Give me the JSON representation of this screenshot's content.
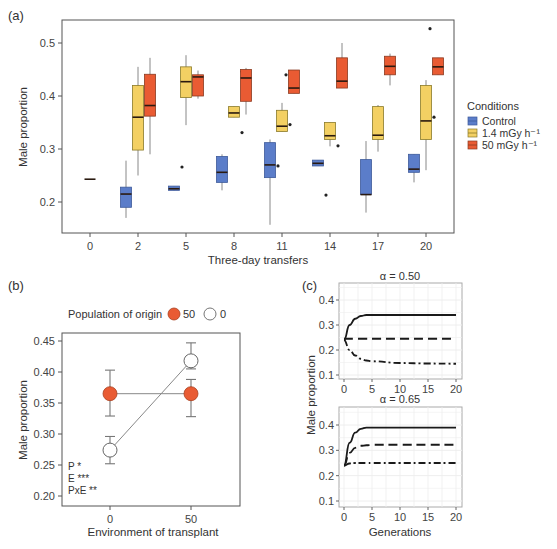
{
  "panels": {
    "a": {
      "label": "(a)"
    },
    "b": {
      "label": "(b)"
    },
    "c": {
      "label": "(c)"
    }
  },
  "colors": {
    "control": "#5b7dc9",
    "low": "#f3d063",
    "high": "#e95b33",
    "axis": "#555555",
    "outline_control": "#3d5a9a",
    "outline_low": "#8a7a2a",
    "outline_high": "#8a3a20"
  },
  "chart_data": [
    {
      "panel": "a",
      "type": "box",
      "title": "",
      "xlabel": "Three-day transfers",
      "ylabel": "Male proportion",
      "ylim": [
        0.14,
        0.55
      ],
      "yticks": [
        0.2,
        0.3,
        0.4,
        0.5
      ],
      "categories": [
        "0",
        "2",
        "5",
        "8",
        "11",
        "14",
        "17",
        "20"
      ],
      "legend": {
        "title": "Conditions",
        "entries": [
          "Control",
          "1.4 mGy h⁻¹",
          "50 mGy h⁻¹"
        ]
      },
      "series": [
        {
          "name": "Control",
          "boxes": [
            {
              "x": "0",
              "min": 0.243,
              "q1": 0.243,
              "median": 0.243,
              "q3": 0.243,
              "max": 0.243,
              "outliers": []
            },
            {
              "x": "2",
              "min": 0.17,
              "q1": 0.19,
              "median": 0.215,
              "q3": 0.228,
              "max": 0.278,
              "outliers": []
            },
            {
              "x": "5",
              "min": 0.222,
              "q1": 0.222,
              "median": 0.225,
              "q3": 0.23,
              "max": 0.23,
              "outliers": [
                0.266
              ]
            },
            {
              "x": "8",
              "min": 0.222,
              "q1": 0.237,
              "median": 0.256,
              "q3": 0.286,
              "max": 0.29,
              "outliers": []
            },
            {
              "x": "11",
              "min": 0.157,
              "q1": 0.246,
              "median": 0.27,
              "q3": 0.312,
              "max": 0.318,
              "outliers": [
                0.268
              ]
            },
            {
              "x": "14",
              "min": 0.268,
              "q1": 0.268,
              "median": 0.273,
              "q3": 0.279,
              "max": 0.279,
              "outliers": [
                0.213
              ]
            },
            {
              "x": "17",
              "min": 0.18,
              "q1": 0.214,
              "median": 0.214,
              "q3": 0.28,
              "max": 0.315,
              "outliers": []
            },
            {
              "x": "20",
              "min": 0.237,
              "q1": 0.256,
              "median": 0.262,
              "q3": 0.29,
              "max": 0.29,
              "outliers": []
            }
          ]
        },
        {
          "name": "1.4 mGy h⁻¹",
          "boxes": [
            {
              "x": "2",
              "min": 0.25,
              "q1": 0.298,
              "median": 0.36,
              "q3": 0.42,
              "max": 0.455,
              "outliers": []
            },
            {
              "x": "5",
              "min": 0.345,
              "q1": 0.397,
              "median": 0.427,
              "q3": 0.455,
              "max": 0.477,
              "outliers": []
            },
            {
              "x": "8",
              "min": 0.36,
              "q1": 0.36,
              "median": 0.368,
              "q3": 0.38,
              "max": 0.38,
              "outliers": [
                0.446,
                0.331
              ]
            },
            {
              "x": "11",
              "min": 0.333,
              "q1": 0.333,
              "median": 0.343,
              "q3": 0.373,
              "max": 0.387,
              "outliers": [
                0.346
              ]
            },
            {
              "x": "14",
              "min": 0.305,
              "q1": 0.318,
              "median": 0.325,
              "q3": 0.35,
              "max": 0.35,
              "outliers": [
                0.306
              ]
            },
            {
              "x": "17",
              "min": 0.295,
              "q1": 0.318,
              "median": 0.326,
              "q3": 0.38,
              "max": 0.383,
              "outliers": []
            },
            {
              "x": "20",
              "min": 0.26,
              "q1": 0.318,
              "median": 0.353,
              "q3": 0.42,
              "max": 0.43,
              "outliers": [
                0.36
              ]
            }
          ]
        },
        {
          "name": "50 mGy h⁻¹",
          "boxes": [
            {
              "x": "2",
              "min": 0.29,
              "q1": 0.362,
              "median": 0.382,
              "q3": 0.441,
              "max": 0.472,
              "outliers": []
            },
            {
              "x": "5",
              "min": 0.395,
              "q1": 0.4,
              "median": 0.436,
              "q3": 0.44,
              "max": 0.448,
              "outliers": []
            },
            {
              "x": "8",
              "min": 0.365,
              "q1": 0.39,
              "median": 0.434,
              "q3": 0.45,
              "max": 0.453,
              "outliers": []
            },
            {
              "x": "11",
              "min": 0.405,
              "q1": 0.405,
              "median": 0.415,
              "q3": 0.449,
              "max": 0.449,
              "outliers": [
                0.44
              ]
            },
            {
              "x": "14",
              "min": 0.415,
              "q1": 0.415,
              "median": 0.428,
              "q3": 0.472,
              "max": 0.5,
              "outliers": []
            },
            {
              "x": "17",
              "min": 0.42,
              "q1": 0.44,
              "median": 0.456,
              "q3": 0.475,
              "max": 0.48,
              "outliers": []
            },
            {
              "x": "20",
              "min": 0.44,
              "q1": 0.44,
              "median": 0.455,
              "q3": 0.472,
              "max": 0.472,
              "outliers": [
                0.527
              ]
            }
          ]
        }
      ]
    },
    {
      "panel": "b",
      "type": "line",
      "title": "",
      "xlabel": "Environment of transplant",
      "ylabel": "Male proportion",
      "ylim": [
        0.195,
        0.46
      ],
      "yticks": [
        0.2,
        0.25,
        0.3,
        0.35,
        0.4,
        0.45
      ],
      "categories": [
        "0",
        "50"
      ],
      "legend": {
        "title": "Population of origin",
        "entries": [
          "50",
          "0"
        ],
        "position": "top"
      },
      "series": [
        {
          "name": "50",
          "marker": "filled",
          "values": [
            0.365,
            0.365
          ],
          "err_low": [
            0.329,
            0.328
          ],
          "err_high": [
            0.403,
            0.388
          ]
        },
        {
          "name": "0",
          "marker": "open",
          "values": [
            0.274,
            0.418
          ],
          "err_low": [
            0.252,
            0.405
          ],
          "err_high": [
            0.296,
            0.447
          ]
        }
      ],
      "annotations": [
        "P *",
        "E ***",
        "PxE **"
      ]
    },
    {
      "panel": "c",
      "type": "line",
      "facets": [
        {
          "title": "α = 0.50",
          "x": [
            0,
            1,
            2,
            3,
            4,
            5,
            10,
            15,
            20
          ],
          "series": [
            {
              "style": "solid",
              "values": [
                0.24,
                0.3,
                0.325,
                0.336,
                0.34,
                0.34,
                0.34,
                0.34,
                0.34
              ]
            },
            {
              "style": "dashed",
              "values": [
                0.245,
                0.245,
                0.245,
                0.245,
                0.245,
                0.245,
                0.245,
                0.245,
                0.245
              ]
            },
            {
              "style": "dashdot",
              "values": [
                0.24,
                0.2,
                0.178,
                0.165,
                0.158,
                0.155,
                0.148,
                0.146,
                0.145
              ]
            }
          ]
        },
        {
          "title": "α = 0.65",
          "x": [
            0,
            1,
            2,
            3,
            4,
            5,
            10,
            15,
            20
          ],
          "series": [
            {
              "style": "solid",
              "values": [
                0.24,
                0.33,
                0.37,
                0.385,
                0.39,
                0.39,
                0.39,
                0.39,
                0.39
              ]
            },
            {
              "style": "dashed",
              "values": [
                0.24,
                0.29,
                0.31,
                0.318,
                0.32,
                0.322,
                0.322,
                0.322,
                0.322
              ]
            },
            {
              "style": "dashdot",
              "values": [
                0.24,
                0.248,
                0.25,
                0.25,
                0.25,
                0.25,
                0.25,
                0.25,
                0.25
              ]
            }
          ]
        }
      ],
      "xlabel": "Generations",
      "ylabel": "Male proportion",
      "ylim": [
        0.09,
        0.46
      ],
      "yticks": [
        0.1,
        0.2,
        0.3,
        0.4
      ],
      "xticks": [
        0,
        5,
        10,
        15,
        20
      ]
    }
  ]
}
